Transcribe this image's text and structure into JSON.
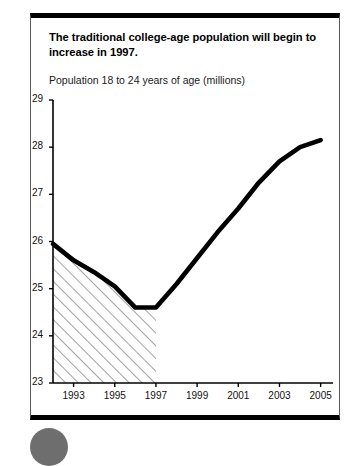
{
  "headline": "The traditional college-age population will begin to increase in 1997.",
  "axis_caption": "Population 18 to 24 years of age (millions)",
  "icons": {
    "page_bullet": "filled-circle-icon"
  },
  "colors": {
    "line": "#000000",
    "frame": "#000000",
    "hatch": "#555555",
    "bullet": "#6e6e6e",
    "background": "#ffffff"
  },
  "chart_data": {
    "type": "line",
    "title": "The traditional college-age population will begin to increase in 1997.",
    "subtitle": "Population 18 to 24 years of age (millions)",
    "xlabel": "",
    "ylabel": "Population 18 to 24 years of age (millions)",
    "xlim": [
      1992,
      2005.6
    ],
    "ylim": [
      23,
      29
    ],
    "yticks": [
      23,
      24,
      25,
      26,
      27,
      28,
      29
    ],
    "ytick_labels": [
      "23",
      "24",
      "25",
      "26",
      "27",
      "28",
      "29"
    ],
    "xticks": [
      1993,
      1995,
      1997,
      1999,
      2001,
      2003,
      2005
    ],
    "xtick_labels": [
      "1993",
      "1995",
      "1997",
      "1999",
      "2001",
      "2003",
      "2005"
    ],
    "grid": false,
    "legend": null,
    "series": [
      {
        "name": "Population 18 to 24 years of age (millions)",
        "x": [
          1992,
          1993,
          1994,
          1995,
          1996,
          1997,
          1998,
          1999,
          2000,
          2001,
          2002,
          2003,
          2004,
          2005
        ],
        "values": [
          25.95,
          25.6,
          25.35,
          25.05,
          24.6,
          24.6,
          25.1,
          25.65,
          26.2,
          26.7,
          27.25,
          27.7,
          28.0,
          28.15
        ]
      }
    ],
    "annotations": [
      {
        "type": "hatched-region",
        "label": "historical-shading",
        "x_start": 1992,
        "x_end": 1997,
        "y_base": 23,
        "description": "Diagonal hatch fill under the line from 1992 through 1997"
      }
    ]
  }
}
